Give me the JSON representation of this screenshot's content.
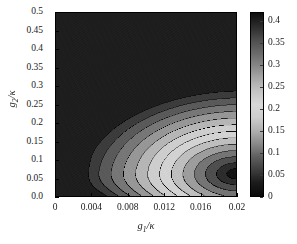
{
  "chart_data": {
    "type": "heatmap",
    "title": "",
    "subtitle": "",
    "xlabel": "g_1/κ",
    "ylabel": "g_2/κ",
    "xlabel_parts": {
      "base": "g",
      "sub": "1",
      "denom": "/κ"
    },
    "ylabel_parts": {
      "base": "g",
      "sub": "2",
      "denom": "/κ"
    },
    "xlim": [
      0,
      0.02
    ],
    "ylim": [
      0,
      0.5
    ],
    "xticks": [
      0,
      0.004,
      0.008,
      0.012,
      0.016,
      0.02
    ],
    "xticklabels": [
      "0",
      "0.004",
      "0.008",
      "0.012",
      "0.016",
      "0.02"
    ],
    "yticks": [
      0,
      0.05,
      0.1,
      0.15,
      0.2,
      0.25,
      0.3,
      0.35,
      0.4,
      0.45,
      0.5
    ],
    "yticklabels": [
      "0.0",
      "0.05",
      "0.1",
      "0.15",
      "0.2",
      "0.25",
      "0.3",
      "0.35",
      "0.4",
      "0.45",
      "0.5"
    ],
    "grid": false,
    "legend_position": "none",
    "colormap": "grayscale-nonmonotonic",
    "colorbar": {
      "orientation": "vertical",
      "position": "right",
      "vmin": 0,
      "vmax": 0.42,
      "ticks": [
        0,
        0.05,
        0.1,
        0.15,
        0.2,
        0.25,
        0.3,
        0.35,
        0.4
      ],
      "ticklabels": [
        "0",
        "0.05",
        "0.1",
        "0.15",
        "0.2",
        "0.25",
        "0.3",
        "0.35",
        "0.4"
      ],
      "ramp_stops": [
        {
          "value": 0.0,
          "gray": 10
        },
        {
          "value": 0.03,
          "gray": 28
        },
        {
          "value": 0.06,
          "gray": 62
        },
        {
          "value": 0.09,
          "gray": 96
        },
        {
          "value": 0.12,
          "gray": 138
        },
        {
          "value": 0.15,
          "gray": 176
        },
        {
          "value": 0.18,
          "gray": 205
        },
        {
          "value": 0.21,
          "gray": 216
        },
        {
          "value": 0.24,
          "gray": 196
        },
        {
          "value": 0.27,
          "gray": 168
        },
        {
          "value": 0.3,
          "gray": 134
        },
        {
          "value": 0.33,
          "gray": 104
        },
        {
          "value": 0.36,
          "gray": 76
        },
        {
          "value": 0.39,
          "gray": 44
        },
        {
          "value": 0.42,
          "gray": 16
        }
      ]
    },
    "contour_levels": [
      0.03,
      0.06,
      0.09,
      0.12,
      0.15,
      0.18,
      0.21,
      0.24,
      0.27,
      0.3,
      0.33,
      0.36,
      0.39
    ],
    "contour_line_color": "#000000",
    "field_description": "Nested crescent-shaped contour bands opening to the left; global minimum near g1/kappa = 0.02, g2/kappa = 0.06; values rise toward the upper-left corner and toward g1/kappa = 0.",
    "field_minimum": {
      "x": 0.02,
      "y": 0.06,
      "value": 0.0
    },
    "field_maximum_region": {
      "x": 0.0,
      "y": 0.5,
      "value": 0.42
    },
    "sample_points": [
      {
        "x": 0.0,
        "y": 0.0,
        "value": 0.42
      },
      {
        "x": 0.0,
        "y": 0.25,
        "value": 0.42
      },
      {
        "x": 0.0,
        "y": 0.5,
        "value": 0.42
      },
      {
        "x": 0.004,
        "y": 0.06,
        "value": 0.2
      },
      {
        "x": 0.004,
        "y": 0.3,
        "value": 0.4
      },
      {
        "x": 0.008,
        "y": 0.06,
        "value": 0.13
      },
      {
        "x": 0.008,
        "y": 0.3,
        "value": 0.33
      },
      {
        "x": 0.012,
        "y": 0.06,
        "value": 0.09
      },
      {
        "x": 0.012,
        "y": 0.3,
        "value": 0.28
      },
      {
        "x": 0.016,
        "y": 0.06,
        "value": 0.05
      },
      {
        "x": 0.016,
        "y": 0.3,
        "value": 0.24
      },
      {
        "x": 0.02,
        "y": 0.06,
        "value": 0.01
      },
      {
        "x": 0.02,
        "y": 0.3,
        "value": 0.21
      },
      {
        "x": 0.02,
        "y": 0.5,
        "value": 0.3
      }
    ]
  }
}
